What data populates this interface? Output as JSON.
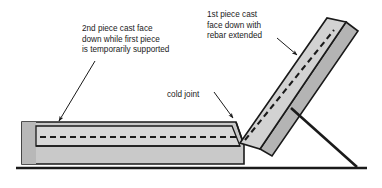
{
  "figure": {
    "background_color": "#ffffff",
    "ground_line_color": "#1a1a1a"
  },
  "colors": {
    "outline": "#1a1a1a",
    "concrete_fill": "#c9c9c9",
    "concrete_fill_light": "#d8d8d8",
    "concrete_edge_dark": "#b0b0b0",
    "panel_fill": "#d2d2d2",
    "panel_edge_strip": "#b4b4b4",
    "rebar_dash": "#1a1a1a",
    "leader_line": "#1a1a1a",
    "text": "#1a1a1a"
  },
  "annotations": [
    {
      "id": "second-piece-note",
      "lines": [
        "2nd piece cast face",
        "down while first piece",
        "is temporarily supported"
      ],
      "x": 82,
      "y": 31,
      "line_height": 10.5,
      "anchor": "start",
      "leader": {
        "x1": 95,
        "y1": 61,
        "x2": 59,
        "y2": 121
      }
    },
    {
      "id": "first-piece-note",
      "lines": [
        "1st piece cast",
        "face down with",
        "rebar extended"
      ],
      "x": 207,
      "y": 17,
      "line_height": 10.5,
      "anchor": "start",
      "leader": {
        "x1": 277,
        "y1": 38,
        "x2": 297,
        "y2": 55
      }
    },
    {
      "id": "cold-joint-note",
      "lines": [
        "cold joint"
      ],
      "x": 167,
      "y": 97,
      "line_height": 10.5,
      "anchor": "start",
      "leader": {
        "x1": 214,
        "y1": 92,
        "x2": 233,
        "y2": 118
      }
    }
  ],
  "geometry": {
    "ground_line": {
      "x1": 16,
      "y1": 168,
      "x2": 367,
      "y2": 168,
      "width": 2.6
    },
    "slab_outer": "M22,122 L236,122 L244,145 L244,164 L22,164 Z",
    "slab_left_strip": "M22,122 L36,122 L36,164 L22,164 Z",
    "slab_inner_band": "M36,126 L232,126 L240,146 L36,146 Z",
    "slab_bottom_divider": {
      "x1": 36,
      "y1": 146,
      "x2": 240,
      "y2": 146
    },
    "slab_rebar_dash": {
      "x1": 40,
      "y1": 137,
      "x2": 237,
      "y2": 137
    },
    "joint_edge": {
      "x1": 236,
      "y1": 122,
      "x2": 244,
      "y2": 145
    },
    "panel_face": "M240,143 L327,18 L346,22 L260,149 Z",
    "panel_edge_strip": "M260,149 L346,22 L358,31 L272,156 Z",
    "panel_rebar_dash": {
      "x1": 245,
      "y1": 140,
      "x2": 334,
      "y2": 30
    },
    "brace": {
      "x1": 291,
      "y1": 108,
      "x2": 357,
      "y2": 167,
      "width": 2.6
    }
  }
}
